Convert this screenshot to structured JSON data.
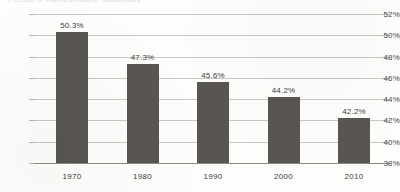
{
  "figure": {
    "clipped_title": "Percent of married-couple households",
    "background_color": "#fdfdfc",
    "bar_color": "#595651",
    "gridline_color": "#c9c7c4"
  },
  "chart_data": {
    "type": "bar",
    "title": "",
    "xlabel": "",
    "ylabel": "",
    "categories": [
      "1970",
      "1980",
      "1990",
      "2000",
      "2010"
    ],
    "values": [
      50.3,
      47.3,
      45.6,
      44.2,
      42.2
    ],
    "value_labels": [
      "50.3%",
      "47.3%",
      "45.6%",
      "44.2%",
      "42.2%"
    ],
    "ylim": [
      38,
      52
    ],
    "ytick_values": [
      52,
      50,
      48,
      46,
      44,
      42,
      40,
      38
    ],
    "ytick_labels": [
      "52%",
      "50%",
      "48%",
      "46%",
      "44%",
      "42%",
      "40%",
      "38%"
    ],
    "grid": true,
    "legend": null,
    "legend_position": "none"
  }
}
